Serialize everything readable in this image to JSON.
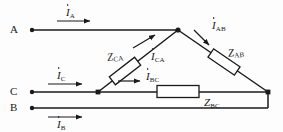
{
  "figure": {
    "type": "circuit-diagram",
    "stroke_color": "#1a1a1a",
    "background_color": "#fdfdfd"
  },
  "terminals": [
    {
      "id": "A",
      "label": "A",
      "x": 22,
      "y": 30
    },
    {
      "id": "C",
      "label": "C",
      "x": 22,
      "y": 92
    },
    {
      "id": "B",
      "label": "B",
      "x": 22,
      "y": 108
    }
  ],
  "line_currents": [
    {
      "id": "IA",
      "symbol": "I",
      "subscript": "A",
      "phasor": true
    },
    {
      "id": "IC",
      "symbol": "I",
      "subscript": "C",
      "phasor": true
    },
    {
      "id": "IB",
      "symbol": "I",
      "subscript": "B",
      "phasor": true
    }
  ],
  "phase_currents": [
    {
      "id": "IAB",
      "symbol": "I",
      "subscript": "AB",
      "phasor": true
    },
    {
      "id": "IBC",
      "symbol": "I",
      "subscript": "BC",
      "phasor": true
    },
    {
      "id": "ICA",
      "symbol": "I",
      "subscript": "CA",
      "phasor": true
    }
  ],
  "impedances": [
    {
      "id": "ZAB",
      "symbol": "Z",
      "subscript": "AB"
    },
    {
      "id": "ZBC",
      "symbol": "Z",
      "subscript": "BC"
    },
    {
      "id": "ZCA",
      "symbol": "Z",
      "subscript": "CA"
    }
  ],
  "labels": {
    "terminal_a": "A",
    "terminal_b": "B",
    "terminal_c": "C",
    "i_a": "I",
    "i_a_sub": "A",
    "i_b": "I",
    "i_b_sub": "B",
    "i_c": "I",
    "i_c_sub": "C",
    "i_ab": "I",
    "i_ab_sub": "AB",
    "i_bc": "I",
    "i_bc_sub": "BC",
    "i_ca": "I",
    "i_ca_sub": "CA",
    "z_ab": "Z",
    "z_ab_sub": "AB",
    "z_bc": "Z",
    "z_bc_sub": "BC",
    "z_ca": "Z",
    "z_ca_sub": "CA"
  }
}
